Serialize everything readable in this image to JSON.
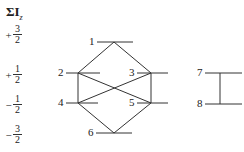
{
  "axis": {
    "title_main": "ΣI",
    "title_sub": "z",
    "ticks": [
      {
        "sign": "+",
        "num": "3",
        "den": "2",
        "y": 42
      },
      {
        "sign": "+",
        "num": "1",
        "den": "2",
        "y": 73
      },
      {
        "sign": "−",
        "num": "1",
        "den": "2",
        "y": 103
      },
      {
        "sign": "−",
        "num": "3",
        "den": "2",
        "y": 133
      }
    ]
  },
  "levels": [
    {
      "label": "1",
      "value": "+3/2"
    },
    {
      "label": "2",
      "value": "+1/2"
    },
    {
      "label": "3",
      "value": "+1/2"
    },
    {
      "label": "4",
      "value": "-1/2"
    },
    {
      "label": "5",
      "value": "-1/2"
    },
    {
      "label": "6",
      "value": "-3/2"
    },
    {
      "label": "7",
      "value": "+1/2"
    },
    {
      "label": "8",
      "value": "-1/2"
    }
  ],
  "connections": [
    [
      "1",
      "2"
    ],
    [
      "1",
      "3"
    ],
    [
      "2",
      "4"
    ],
    [
      "2",
      "5"
    ],
    [
      "3",
      "4"
    ],
    [
      "3",
      "5"
    ],
    [
      "4",
      "6"
    ],
    [
      "5",
      "6"
    ],
    [
      "7",
      "8"
    ]
  ]
}
